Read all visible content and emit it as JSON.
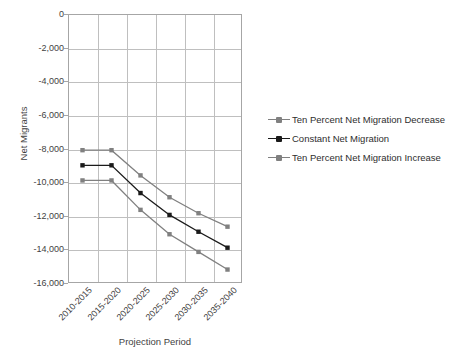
{
  "cut_off_header": "",
  "chart_data": {
    "type": "line",
    "title": "",
    "xlabel": "Projection Period",
    "ylabel": "Net Migrants",
    "categories": [
      "2010-2015",
      "2015-2020",
      "2020-2025",
      "2025-2030",
      "2030-2035",
      "2035-2040"
    ],
    "ylim": [
      -16000,
      0
    ],
    "yticks": [
      0,
      -2000,
      -4000,
      -6000,
      -8000,
      -10000,
      -12000,
      -14000,
      -16000
    ],
    "ytick_labels": [
      "0",
      "-2,000",
      "-4,000",
      "-6,000",
      "-8,000",
      "-10,000",
      "-12,000",
      "-14,000",
      "-16,000"
    ],
    "grid": true,
    "legend_position": "right",
    "series": [
      {
        "name": "Ten Percent Net Migration Decrease",
        "color": "#808080",
        "marker": "square",
        "values": [
          -8100,
          -8100,
          -9600,
          -10900,
          -11850,
          -12650
        ]
      },
      {
        "name": "Constant Net Migration",
        "color": "#1a1a1a",
        "marker": "square",
        "values": [
          -9000,
          -9000,
          -10650,
          -11950,
          -12950,
          -13900
        ]
      },
      {
        "name": "Ten Percent Net Migration Increase",
        "color": "#808080",
        "marker": "square",
        "values": [
          -9900,
          -9900,
          -11650,
          -13100,
          -14150,
          -15200
        ]
      }
    ]
  },
  "colors": {
    "frame": "#a6a6a6",
    "grid": "#bfbfbf",
    "text": "#3f3f3f",
    "background": "#ffffff"
  }
}
